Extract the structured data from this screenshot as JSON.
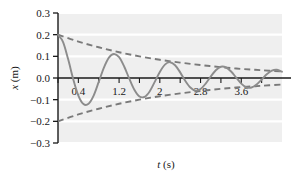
{
  "chart_data": {
    "type": "line",
    "title": "",
    "xlabel": "t (s)",
    "ylabel": "x (m)",
    "xlim": [
      0,
      4.4
    ],
    "ylim": [
      -0.3,
      0.3
    ],
    "grid": true,
    "legend": "none",
    "xticks": [
      0.4,
      1.2,
      2,
      2.8,
      3.6
    ],
    "xtick_labels": [
      "0.4",
      "1.2",
      "2",
      "2.8",
      "3.6"
    ],
    "xtick_minor": [
      0,
      0.4,
      0.8,
      1.2,
      1.6,
      2.0,
      2.4,
      2.8,
      3.2,
      3.6,
      4.0
    ],
    "yticks": [
      -0.3,
      -0.2,
      -0.1,
      0.0,
      0.1,
      0.2,
      0.3
    ],
    "ytick_labels": [
      "−0.3",
      "−0.2",
      "−0.1",
      "0.0",
      "0.1",
      "0.2",
      "0.3"
    ],
    "series": [
      {
        "name": "damped oscillation",
        "style": "solid",
        "color": "#8c8c8c",
        "amplitude": 0.2,
        "period": 1.2,
        "decay_time_constant": 2.3,
        "equation": "x = 0.2 e^(-t/2.3) cos(2πt/1.2)",
        "x": [
          0,
          0.1,
          0.2,
          0.3,
          0.4,
          0.5,
          0.6,
          0.7,
          0.8,
          0.9,
          1.0,
          1.1,
          1.2,
          1.3,
          1.4,
          1.5,
          1.6,
          1.7,
          1.8,
          1.9,
          2.0,
          2.1,
          2.2,
          2.3,
          2.4,
          2.5,
          2.6,
          2.7,
          2.8,
          2.9,
          3.0,
          3.1,
          3.2,
          3.3,
          3.4,
          3.5,
          3.6,
          3.7,
          3.8,
          3.9,
          4.0,
          4.1,
          4.2,
          4.3,
          4.4
        ],
        "y": [
          0.2,
          0.166,
          0.086,
          -0.006,
          -0.081,
          -0.12,
          -0.119,
          -0.081,
          -0.018,
          0.047,
          0.094,
          0.111,
          0.096,
          0.053,
          -0.003,
          -0.054,
          -0.085,
          -0.087,
          -0.062,
          -0.018,
          0.028,
          0.062,
          0.073,
          0.059,
          0.026,
          -0.013,
          -0.044,
          -0.058,
          -0.051,
          -0.026,
          0.007,
          0.036,
          0.052,
          0.049,
          0.03,
          0.002,
          -0.026,
          -0.043,
          -0.044,
          -0.03,
          -0.007,
          0.017,
          0.034,
          0.038,
          0.029
        ]
      },
      {
        "name": "upper envelope",
        "style": "dashed",
        "color": "#7a7a7a",
        "equation": "x = +0.2 e^(-t/2.3)",
        "x": [
          0,
          0.4,
          0.8,
          1.2,
          1.6,
          2.0,
          2.4,
          2.8,
          3.2,
          3.6,
          4.0,
          4.4
        ],
        "y": [
          0.2,
          0.168,
          0.142,
          0.119,
          0.1,
          0.084,
          0.071,
          0.06,
          0.05,
          0.042,
          0.036,
          0.03
        ]
      },
      {
        "name": "lower envelope",
        "style": "dashed",
        "color": "#7a7a7a",
        "equation": "x = -0.2 e^(-t/2.3)",
        "x": [
          0,
          0.4,
          0.8,
          1.2,
          1.6,
          2.0,
          2.4,
          2.8,
          3.2,
          3.6,
          4.0,
          4.4
        ],
        "y": [
          -0.2,
          -0.168,
          -0.142,
          -0.119,
          -0.1,
          -0.084,
          -0.071,
          -0.06,
          -0.05,
          -0.042,
          -0.036,
          -0.03
        ]
      }
    ],
    "colors": {
      "plot_background": "#efefef",
      "gridline": "#ffffff",
      "axis": "#1a1a1a",
      "curve": "#8c8c8c",
      "envelope": "#7a7a7a",
      "text": "#1a1a1a"
    }
  }
}
